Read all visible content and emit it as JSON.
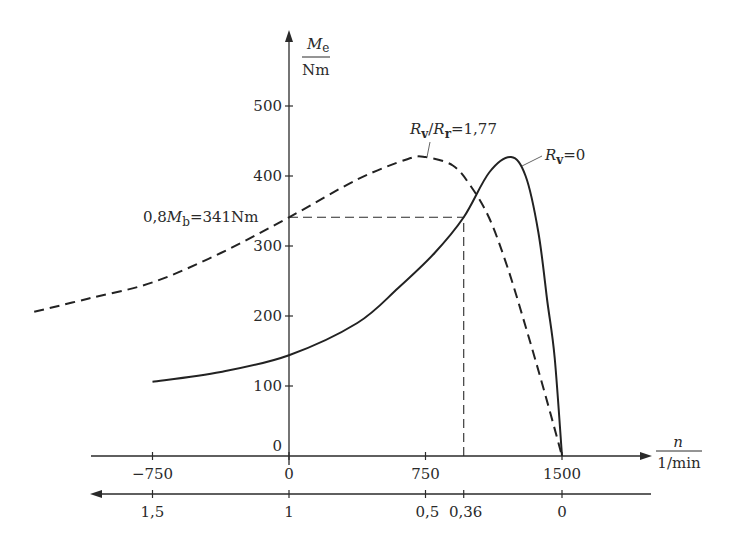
{
  "chart_data": {
    "type": "line",
    "title": "",
    "xlabel": "n / 1/min",
    "ylabel": "M_e / Nm",
    "xlabel_parts": {
      "top": "n",
      "bottom": "1/min"
    },
    "ylabel_parts": {
      "top": "M",
      "top_sub": "e",
      "bottom": "Nm"
    },
    "secondary_xlabel": "slip s",
    "xlim": [
      -1400,
      1750
    ],
    "ylim": [
      0,
      560
    ],
    "grid": false,
    "x_ticks": [
      {
        "value": -750,
        "label": "−750"
      },
      {
        "value": 0,
        "label": "0"
      },
      {
        "value": 750,
        "label": "750"
      },
      {
        "value": 1500,
        "label": "1500"
      }
    ],
    "slip_ticks": [
      {
        "n": -750,
        "label": "1,5"
      },
      {
        "n": 0,
        "label": "1"
      },
      {
        "n": 750,
        "label": "0,5"
      },
      {
        "n": 960,
        "label": "0,36"
      },
      {
        "n": 1500,
        "label": "0"
      }
    ],
    "y_ticks": [
      {
        "value": 0,
        "label": "0"
      },
      {
        "value": 100,
        "label": "100"
      },
      {
        "value": 200,
        "label": "200"
      },
      {
        "value": 300,
        "label": "300"
      },
      {
        "value": 400,
        "label": "400"
      },
      {
        "value": 500,
        "label": "500"
      }
    ],
    "series": [
      {
        "name": "R_v/R_r=1,77",
        "style": "dashed",
        "x": [
          -1400,
          -1100,
          -750,
          -375,
          0,
          375,
          650,
          750,
          900,
          1000,
          1100,
          1200,
          1300,
          1400,
          1500
        ],
        "values": [
          206,
          225,
          248,
          290,
          341,
          395,
          424,
          427,
          415,
          385,
          340,
          270,
          185,
          95,
          0
        ]
      },
      {
        "name": "R_v=0",
        "style": "solid",
        "x": [
          -750,
          -375,
          0,
          375,
          600,
          800,
          960,
          1100,
          1220,
          1300,
          1370,
          1420,
          1460,
          1500
        ],
        "values": [
          106,
          120,
          144,
          190,
          240,
          290,
          341,
          405,
          427,
          400,
          320,
          220,
          140,
          0
        ]
      }
    ],
    "annotations": [
      {
        "text": "0,8M_b=341Nm",
        "parts": [
          "0,8",
          "M",
          "b",
          "=341Nm"
        ],
        "at": {
          "n": 0,
          "M": 341
        }
      },
      {
        "text": "R_v/R_r=1,77",
        "parts": [
          "R",
          "v",
          "/",
          "R",
          "r",
          "=1,77"
        ]
      },
      {
        "text": "R_v=0",
        "parts": [
          "R",
          "v",
          "=0"
        ]
      }
    ],
    "reference_lines": [
      {
        "type": "horizontal",
        "y": 341,
        "from_n": 0,
        "to_n": 960,
        "style": "dashed"
      },
      {
        "type": "vertical",
        "n": 960,
        "from_M": 0,
        "to_M": 341,
        "style": "dashed"
      }
    ]
  }
}
